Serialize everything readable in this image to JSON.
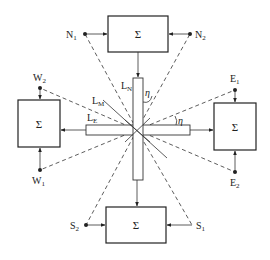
{
  "diagram": {
    "type": "microphone array summing block diagram",
    "blocks": {
      "north": {
        "label": "Σ"
      },
      "west": {
        "label": "Σ"
      },
      "east": {
        "label": "Σ"
      },
      "south": {
        "label": "Σ"
      }
    },
    "nodes": {
      "N1": {
        "main": "N",
        "sub": "1"
      },
      "N2": {
        "main": "N",
        "sub": "2"
      },
      "W1": {
        "main": "W",
        "sub": "1"
      },
      "W2": {
        "main": "W",
        "sub": "2"
      },
      "E1": {
        "main": "E",
        "sub": "1"
      },
      "E2": {
        "main": "E",
        "sub": "2"
      },
      "S1": {
        "main": "S",
        "sub": "1"
      },
      "S2": {
        "main": "S",
        "sub": "2"
      }
    },
    "line_labels": {
      "LN": {
        "main": "L",
        "sub": "N"
      },
      "LM": {
        "main": "L",
        "sub": "M"
      },
      "LE": {
        "main": "L",
        "sub": "E"
      }
    },
    "angle_labels": {
      "eta_vertical": "η",
      "eta_horizontal": "η"
    },
    "colors": {
      "line": "#333333",
      "background": "#ffffff"
    }
  }
}
